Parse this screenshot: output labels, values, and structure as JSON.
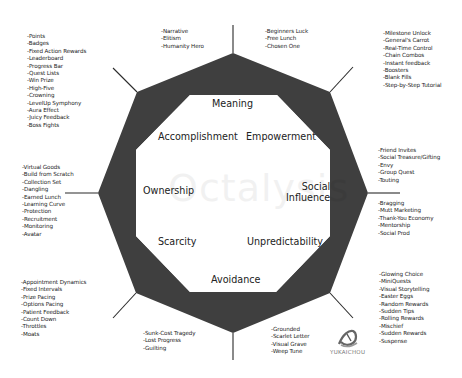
{
  "title": "Octalysis",
  "colors": {
    "ring": "#3f3f3f",
    "inner": "#ffffff",
    "line": "#2a2a2a",
    "text": "#222222"
  },
  "core_drives": {
    "meaning": "Meaning",
    "accomplishment": "Accomplishment",
    "empowerment": "Empowerment",
    "ownership": "Ownership",
    "social_influence_line1": "Social",
    "social_influence_line2": "Influence",
    "scarcity": "Scarcity",
    "unpredictability": "Unpredictability",
    "avoidance": "Avoidance"
  },
  "lists": {
    "top_left": [
      "-Narrative",
      "-Elitism",
      "-Humanity Hero"
    ],
    "top_right": [
      "-Beginners Luck",
      "-Free Lunch",
      "-Chosen One"
    ],
    "upper_left": [
      "-Points",
      "-Badges",
      "-Fixed Action Rewards",
      "-Leaderboard",
      "-Progress Bar",
      "-Quest Lists",
      "-Win Prize",
      "-High-Five",
      "-Crowning",
      "-LevelUp Symphony",
      "-Aura Effect",
      "-Juicy Feedback",
      "-Boss Fights"
    ],
    "upper_right": [
      "-Milestone Unlock",
      "-General's Carrot",
      "-Real-Time Control",
      "-Chain Combos",
      "-Instant feedback",
      "-Boosters",
      "-Blank Fills",
      "-Step-by-Step Tutorial"
    ],
    "left": [
      "-Virtual Goods",
      "-Build from Scratch",
      "-Collection Set",
      "-Dangling",
      "-Earned Lunch",
      "-Learning Curve",
      "-Protection",
      "-Recruitment",
      "-Monitoring",
      "-Avatar"
    ],
    "right_upper": [
      "-Friend Invites",
      "-Social Treasure/Gifting",
      "-Envy",
      "-Group Quest",
      "-Touting"
    ],
    "right_lower": [
      "-Bragging",
      "-Mutt Marketing",
      "-Thank-You Economy",
      "-Mentorship",
      "-Social Prod"
    ],
    "lower_left": [
      "-Appointment Dynamics",
      "-Fixed Intervals",
      "-Prize Pacing",
      "-Options Pacing",
      "-Patient Feedback",
      "-Count Down",
      "-Throttles",
      "-Moats"
    ],
    "lower_right": [
      "-Glowing Choice",
      "-MiniQuests",
      "-Visual Storytelling",
      "-Easter Eggs",
      "-Random Rewards",
      "-Sudden Tips",
      "-Rolling Rewards",
      "-Mischief",
      "-Sudden Rewards",
      "-Suspense"
    ],
    "bottom_left": [
      "-Sunk-Cost Tragedy",
      "-Lost Progress",
      "-Guilting"
    ],
    "bottom_right": [
      "-Grounded",
      "-Scarlet Letter",
      "-Visual Grave",
      "-Weep Tune"
    ]
  },
  "watermark": "Octalysis",
  "logo": {
    "icon": "yukaichou-logo-icon",
    "text": "YUKAICHOU"
  }
}
